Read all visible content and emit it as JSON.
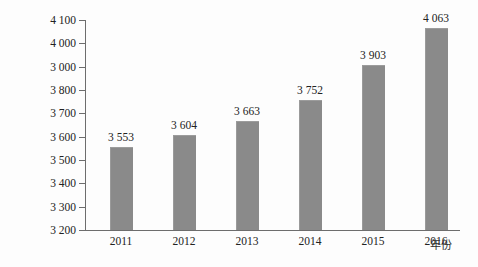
{
  "chart_data": {
    "type": "bar",
    "title": "",
    "xlabel": "年份",
    "ylabel": "销售额/亿美元",
    "categories": [
      "2011",
      "2012",
      "2013",
      "2014",
      "2015",
      "2016"
    ],
    "values": [
      3553,
      3604,
      3663,
      3752,
      3903,
      4063
    ],
    "value_labels": [
      "3 553",
      "3 604",
      "3 663",
      "3 752",
      "3 903",
      "4 063"
    ],
    "ylim": [
      3200,
      4100
    ],
    "ytick_values": [
      4100,
      4000,
      3900,
      3800,
      3700,
      3600,
      3500,
      3400,
      3300,
      3200
    ],
    "ytick_labels": [
      "4 100",
      "4 000",
      "3 000",
      "3 800",
      "3 700",
      "3 600",
      "3 500",
      "3 400",
      "3 300",
      "3 200"
    ],
    "grid": false,
    "legend": false,
    "bar_color": "#8a8a8a",
    "axis_color": "#6d6d6d",
    "text_color": "#222222"
  }
}
